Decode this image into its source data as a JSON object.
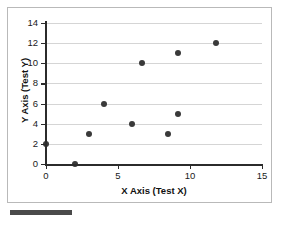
{
  "chart_data": {
    "type": "scatter",
    "title": "",
    "xlabel": "X Axis (Test X)",
    "ylabel": "Y Axis (Test Y)",
    "xlim": [
      0,
      15
    ],
    "ylim": [
      0,
      14
    ],
    "xticks": [
      0,
      5,
      10,
      15
    ],
    "yticks": [
      0,
      2,
      4,
      6,
      8,
      10,
      12,
      14
    ],
    "xtick_labels": [
      "0",
      "5",
      "10",
      "15"
    ],
    "ytick_labels": [
      "0",
      "2",
      "4",
      "6",
      "8",
      "10",
      "12",
      "14"
    ],
    "grid": "horizontal",
    "legend": "none",
    "marker": {
      "shape": "circle",
      "color": "#3a3a3a",
      "size_px": 6
    },
    "points": [
      {
        "x": 0.0,
        "y": 2
      },
      {
        "x": 2.0,
        "y": 0
      },
      {
        "x": 3.0,
        "y": 3
      },
      {
        "x": 4.0,
        "y": 6
      },
      {
        "x": 6.0,
        "y": 4
      },
      {
        "x": 6.7,
        "y": 10
      },
      {
        "x": 8.5,
        "y": 3
      },
      {
        "x": 9.2,
        "y": 5
      },
      {
        "x": 9.2,
        "y": 11
      },
      {
        "x": 11.8,
        "y": 12
      }
    ]
  },
  "colors": {
    "marker": "#3a3a3a",
    "axis": "#2b2b2b",
    "gridline": "#d5d5d5",
    "frame": "#b9b9b9",
    "footer_bar": "#4a4a4a",
    "background": "#ffffff"
  }
}
